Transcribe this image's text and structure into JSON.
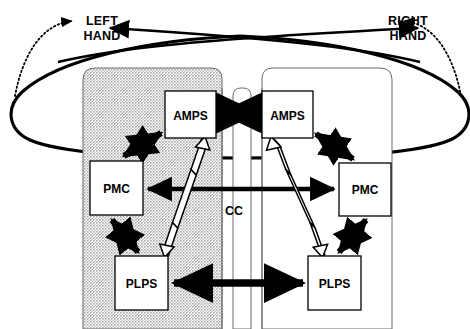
{
  "figure": {
    "type": "neuroanatomical block diagram"
  },
  "labels": {
    "left_hand_line1": "LEFT",
    "left_hand_line2": "HAND",
    "right_hand_line1": "RIGHT",
    "right_hand_line2": "HAND",
    "corpus_callosum": "CC"
  },
  "hemispheres": [
    {
      "id": "left",
      "name": "left-hemisphere",
      "fill": "#cccccc",
      "shaded": true,
      "nodes": [
        {
          "id": "left-amps",
          "label": "AMPS",
          "x": 165,
          "y": 91,
          "w": 51,
          "h": 47
        },
        {
          "id": "left-pmc",
          "label": "PMC",
          "x": 90,
          "y": 161,
          "w": 53,
          "h": 54
        },
        {
          "id": "left-plps",
          "label": "PLPS",
          "x": 115,
          "y": 256,
          "w": 53,
          "h": 54
        }
      ]
    },
    {
      "id": "right",
      "name": "right-hemisphere",
      "fill": "#ffffff",
      "shaded": false,
      "nodes": [
        {
          "id": "right-amps",
          "label": "AMPS",
          "x": 262,
          "y": 91,
          "w": 51,
          "h": 47
        },
        {
          "id": "right-pmc",
          "label": "PMC",
          "x": 339,
          "y": 163,
          "w": 52,
          "h": 53
        },
        {
          "id": "right-plps",
          "label": "PLPS",
          "x": 308,
          "y": 256,
          "w": 53,
          "h": 54
        }
      ]
    }
  ],
  "connections": [
    {
      "id": "amps-amps",
      "style": "solid-filled",
      "kind": "bidirectional",
      "from": "left-amps",
      "to": "right-amps",
      "via": "CC"
    },
    {
      "id": "pmc-pmc",
      "style": "solid-filled",
      "kind": "bidirectional",
      "from": "left-pmc",
      "to": "right-pmc",
      "via": "CC"
    },
    {
      "id": "plps-plps",
      "style": "solid-filled",
      "kind": "bidirectional",
      "from": "left-plps",
      "to": "right-plps",
      "via": "CC"
    },
    {
      "id": "left-amps-pmc",
      "style": "solid-filled",
      "kind": "bidirectional",
      "from": "left-amps",
      "to": "left-pmc"
    },
    {
      "id": "left-pmc-plps",
      "style": "solid-filled",
      "kind": "bidirectional",
      "from": "left-pmc",
      "to": "left-plps"
    },
    {
      "id": "left-amps-plps",
      "style": "hollow-outline",
      "kind": "bidirectional",
      "from": "left-amps",
      "to": "left-plps"
    },
    {
      "id": "right-amps-pmc",
      "style": "solid-filled",
      "kind": "bidirectional",
      "from": "right-amps",
      "to": "right-pmc"
    },
    {
      "id": "right-pmc-plps",
      "style": "solid-filled",
      "kind": "bidirectional",
      "from": "right-pmc",
      "to": "right-plps"
    },
    {
      "id": "right-amps-plps",
      "style": "hollow-outline",
      "kind": "bidirectional",
      "from": "right-amps",
      "to": "right-plps"
    },
    {
      "id": "left-hand-crossed",
      "style": "solid-thin",
      "kind": "unidirectional",
      "from": "right-hemisphere",
      "to": "LEFT HAND",
      "crossed": true
    },
    {
      "id": "right-hand-crossed",
      "style": "solid-thin",
      "kind": "unidirectional",
      "from": "left-hemisphere",
      "to": "RIGHT HAND",
      "crossed": true
    },
    {
      "id": "left-hand-ipsilateral",
      "style": "dotted",
      "kind": "unidirectional",
      "from": "left-hemisphere",
      "to": "LEFT HAND",
      "crossed": false
    },
    {
      "id": "right-hand-ipsilateral",
      "style": "dotted",
      "kind": "unidirectional",
      "from": "right-hemisphere",
      "to": "RIGHT HAND",
      "crossed": false
    }
  ],
  "colors": {
    "stroke": "#000000",
    "shade_fill": "#cccccc",
    "box_fill": "#ffffff",
    "page_bg": "#ffffff"
  }
}
